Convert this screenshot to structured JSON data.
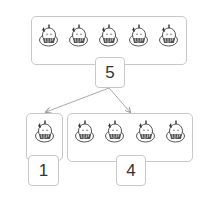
{
  "diagram": {
    "whole": {
      "count": 5,
      "label": "5"
    },
    "parts": [
      {
        "count": 1,
        "label": "1"
      },
      {
        "count": 4,
        "label": "4"
      }
    ],
    "icon": "cartoon-creature-icon",
    "colors": {
      "border": "#c8c8c8",
      "arrow": "#999999",
      "text": "#333333"
    }
  }
}
